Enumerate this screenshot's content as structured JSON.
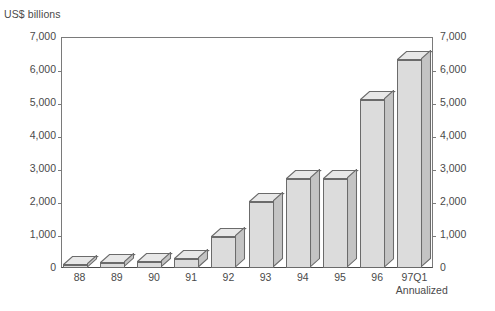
{
  "chart_data": {
    "type": "bar",
    "title": "",
    "subtitle": "",
    "unit_caption": "US$ billions",
    "xlabel": "",
    "ylabel": "US$ billions",
    "ylim": [
      0,
      7000
    ],
    "grid": false,
    "legend": null,
    "dual_axis": true,
    "axis_note": "Identical scale mirrored on left and right spines",
    "categories": [
      "88",
      "89",
      "90",
      "91",
      "92",
      "93",
      "94",
      "95",
      "96",
      "97Q1"
    ],
    "category_sublabels": [
      "",
      "",
      "",
      "",
      "",
      "",
      "",
      "",
      "",
      "Annualized"
    ],
    "values": [
      100,
      140,
      180,
      280,
      950,
      2000,
      2700,
      2700,
      5100,
      6300
    ],
    "ytick_labels": [
      "0",
      "1,000",
      "2,000",
      "3,000",
      "4,000",
      "5,000",
      "6,000",
      "7,000"
    ],
    "ytick_values": [
      0,
      1000,
      2000,
      3000,
      4000,
      5000,
      6000,
      7000
    ],
    "series": [
      {
        "name": "US$ billions",
        "values": [
          100,
          140,
          180,
          280,
          950,
          2000,
          2700,
          2700,
          5100,
          6300
        ]
      }
    ],
    "style": {
      "bar_face_color": "#dcdcdc",
      "bar_top_color": "#e8e8e8",
      "bar_side_color": "#c4c4c4",
      "bar_outline_color": "#6b6b6b",
      "axis_color": "#7a7a7a",
      "text_color": "#4a4a4a",
      "background_color": "#ffffff",
      "three_d": true
    }
  }
}
